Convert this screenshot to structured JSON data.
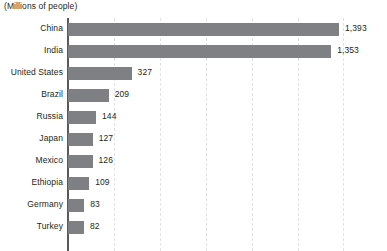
{
  "chart_data": {
    "type": "bar",
    "orientation": "horizontal",
    "title": "(Millions of people)",
    "xlabel": "",
    "ylabel": "",
    "categories": [
      "China",
      "India",
      "United States",
      "Brazil",
      "Russia",
      "Japan",
      "Mexico",
      "Ethiopia",
      "Germany",
      "Turkey"
    ],
    "values": [
      1393,
      1353,
      327,
      209,
      144,
      127,
      126,
      109,
      83,
      82
    ],
    "value_labels": [
      "1,393",
      "1,353",
      "327",
      "209",
      "144",
      "127",
      "126",
      "109",
      "83",
      "82"
    ],
    "xlim": [
      0,
      1640
    ],
    "gridlines": [
      236,
      472,
      708,
      944,
      1180,
      1416
    ],
    "grid": true,
    "grid_style": "dashed-vertical",
    "legend": "none",
    "bar_color": "#7f8083",
    "axis_color": "#58595b",
    "grid_color": "#e2e2e4",
    "text_color": "#231f20",
    "background": "#ffffff"
  }
}
